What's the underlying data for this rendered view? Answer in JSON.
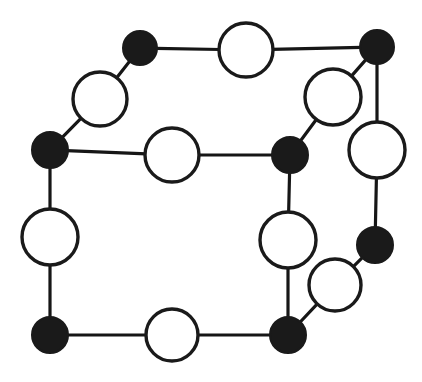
{
  "diagram": {
    "type": "node-link-graph",
    "canvas": {
      "width": 422,
      "height": 382,
      "background": "#ffffff"
    },
    "style": {
      "filled_color": "#1a1a1a",
      "open_fill": "#ffffff",
      "stroke_color": "#1a1a1a",
      "edge_color": "#161616",
      "edge_width": 3.2,
      "open_node_stroke_width": 3.4
    },
    "legend": {
      "filled_label": "filled vertex",
      "open_label": "open vertex"
    },
    "nodes": [
      {
        "id": "n1",
        "name": "top-left-filled",
        "x": 140,
        "y": 48,
        "r": 17,
        "fill": "filled"
      },
      {
        "id": "n2",
        "name": "top-middle-open",
        "x": 246,
        "y": 50,
        "r": 27,
        "fill": "open"
      },
      {
        "id": "n3",
        "name": "top-right-filled",
        "x": 377,
        "y": 47,
        "r": 17,
        "fill": "filled"
      },
      {
        "id": "n4",
        "name": "upper-left-open",
        "x": 100,
        "y": 99,
        "r": 27,
        "fill": "open"
      },
      {
        "id": "n5",
        "name": "upper-right-inner-open",
        "x": 333,
        "y": 97,
        "r": 28,
        "fill": "open"
      },
      {
        "id": "n6",
        "name": "left-filled",
        "x": 50,
        "y": 150,
        "r": 18,
        "fill": "filled"
      },
      {
        "id": "n7",
        "name": "center-open",
        "x": 172,
        "y": 155,
        "r": 27,
        "fill": "open"
      },
      {
        "id": "n8",
        "name": "center-right-filled",
        "x": 290,
        "y": 155,
        "r": 18,
        "fill": "filled"
      },
      {
        "id": "n9",
        "name": "far-right-open",
        "x": 377,
        "y": 150,
        "r": 28,
        "fill": "open"
      },
      {
        "id": "n10",
        "name": "left-middle-open",
        "x": 50,
        "y": 237,
        "r": 28,
        "fill": "open"
      },
      {
        "id": "n11",
        "name": "right-middle-open",
        "x": 288,
        "y": 240,
        "r": 28,
        "fill": "open"
      },
      {
        "id": "n12",
        "name": "right-filled",
        "x": 375,
        "y": 245,
        "r": 18,
        "fill": "filled"
      },
      {
        "id": "n13",
        "name": "lower-right-inner-open",
        "x": 335,
        "y": 285,
        "r": 26,
        "fill": "open"
      },
      {
        "id": "n14",
        "name": "bottom-left-filled",
        "x": 50,
        "y": 335,
        "r": 18,
        "fill": "filled"
      },
      {
        "id": "n15",
        "name": "bottom-middle-open",
        "x": 172,
        "y": 335,
        "r": 26,
        "fill": "open"
      },
      {
        "id": "n16",
        "name": "bottom-right-filled",
        "x": 288,
        "y": 335,
        "r": 18,
        "fill": "filled"
      }
    ],
    "edges": [
      {
        "from": "n1",
        "to": "n2"
      },
      {
        "from": "n2",
        "to": "n3"
      },
      {
        "from": "n1",
        "to": "n4"
      },
      {
        "from": "n4",
        "to": "n6"
      },
      {
        "from": "n3",
        "to": "n5"
      },
      {
        "from": "n3",
        "to": "n9"
      },
      {
        "from": "n5",
        "to": "n8"
      },
      {
        "from": "n6",
        "to": "n7"
      },
      {
        "from": "n7",
        "to": "n8"
      },
      {
        "from": "n6",
        "to": "n10"
      },
      {
        "from": "n10",
        "to": "n14"
      },
      {
        "from": "n8",
        "to": "n11"
      },
      {
        "from": "n11",
        "to": "n16"
      },
      {
        "from": "n9",
        "to": "n12"
      },
      {
        "from": "n12",
        "to": "n13"
      },
      {
        "from": "n13",
        "to": "n16"
      },
      {
        "from": "n14",
        "to": "n15"
      },
      {
        "from": "n15",
        "to": "n16"
      }
    ],
    "counts": {
      "nodes_total": 16,
      "filled_nodes": 7,
      "open_nodes": 9,
      "edges_total": 18
    }
  }
}
